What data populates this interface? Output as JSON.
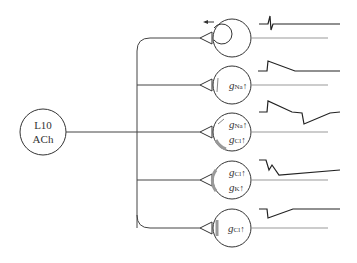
{
  "source_neuron": {
    "line1": "L10",
    "line2": "ACh"
  },
  "targets": [
    {
      "id": "t1",
      "type": "inhibitory-autapse",
      "labels": [],
      "response": "spike-then-flat"
    },
    {
      "id": "t2",
      "labels": [
        {
          "g": "g",
          "sub": "Na",
          "arrow": "↑"
        }
      ],
      "response": "depolarizing-step-decay"
    },
    {
      "id": "t3",
      "labels": [
        {
          "g": "g",
          "sub": "Na",
          "arrow": "↑"
        },
        {
          "g": "g",
          "sub": "Cl",
          "arrow": "↑"
        }
      ],
      "response": "biphasic-depolarize-then-hyperpolarize"
    },
    {
      "id": "t4",
      "labels": [
        {
          "g": "g",
          "sub": "Cl",
          "arrow": "↑"
        },
        {
          "g": "g",
          "sub": "K",
          "arrow": "↑"
        }
      ],
      "response": "biphasic-hyperpolarizing"
    },
    {
      "id": "t5",
      "labels": [
        {
          "g": "g",
          "sub": "Cl",
          "arrow": "↑"
        }
      ],
      "response": "hyperpolarizing-step-recovery"
    }
  ],
  "colors": {
    "line": "#333333",
    "trace": "#222222",
    "baseline": "#888888",
    "shade": "#999999"
  }
}
